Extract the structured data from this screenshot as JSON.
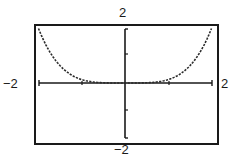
{
  "chart_data": {
    "type": "line",
    "title": "",
    "xlabel": "",
    "ylabel": "",
    "function": "y = x^4 / 8",
    "xlim": [
      -2,
      2
    ],
    "ylim": [
      -2,
      2
    ],
    "x_scale": 1,
    "y_scale": 1,
    "grid": false,
    "legend": null,
    "window_labels": {
      "xmin": "−2",
      "xmax": "2",
      "ymin": "−2",
      "ymax": "2"
    },
    "x_ticks": [
      -1,
      1
    ],
    "y_ticks": [
      -1,
      1
    ],
    "series": [
      {
        "name": "graph",
        "style": "dotted-trace",
        "x": [
          -2,
          -1.75,
          -1.5,
          -1.25,
          -1,
          -0.75,
          -0.5,
          -0.25,
          0,
          0.25,
          0.5,
          0.75,
          1,
          1.25,
          1.5,
          1.75,
          2
        ],
        "values": [
          2,
          1.17,
          0.63,
          0.31,
          0.125,
          0.04,
          0.008,
          0.0005,
          0,
          0.0005,
          0.008,
          0.04,
          0.125,
          0.31,
          0.63,
          1.17,
          2
        ]
      }
    ],
    "colors": {
      "ink": "#1a1a1a",
      "background": "#ffffff"
    }
  }
}
